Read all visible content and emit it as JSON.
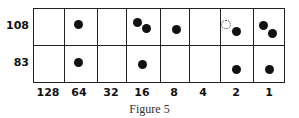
{
  "figure": {
    "caption": "Figure 5",
    "rows": [
      {
        "label": "108"
      },
      {
        "label": "83"
      }
    ],
    "columns": [
      "128",
      "64",
      "32",
      "16",
      "8",
      "4",
      "2",
      "1"
    ],
    "dots": {
      "row_108": {
        "128": 0,
        "64": 1,
        "32": 0,
        "16": 2,
        "8": 1,
        "4": 0,
        "2": 1,
        "1": 2
      },
      "row_83": {
        "128": 0,
        "64": 1,
        "32": 0,
        "16": 1,
        "8": 0,
        "4": 0,
        "2": 1,
        "1": 1
      }
    },
    "removed_dot_marker": {
      "row": "108",
      "column": "2",
      "style": "dotted outline"
    }
  }
}
